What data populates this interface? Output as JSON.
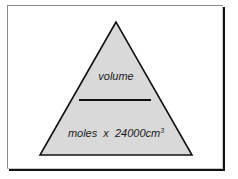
{
  "diagram": {
    "type": "formula-triangle",
    "colors": {
      "fill": "#d9d9d9",
      "stroke": "#111111",
      "frame_shadow": "#111111",
      "background": "#ffffff"
    },
    "top_label": "volume",
    "bottom_label": {
      "text": "moles  x  24000cm",
      "superscript": "3"
    }
  }
}
